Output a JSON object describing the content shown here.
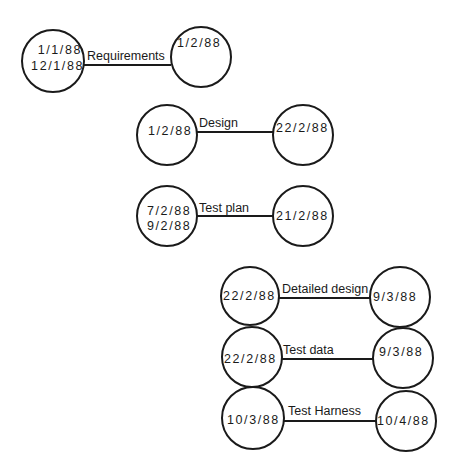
{
  "diagram": {
    "type": "activity-network",
    "activities": [
      {
        "label": "Requirements",
        "start_node": {
          "dates": [
            "1/1/88",
            "12/1/88"
          ]
        },
        "end_node": {
          "dates": [
            "1/2/88"
          ]
        }
      },
      {
        "label": "Design",
        "start_node": {
          "dates": [
            "1/2/88"
          ]
        },
        "end_node": {
          "dates": [
            "22/2/88"
          ]
        }
      },
      {
        "label": "Test plan",
        "start_node": {
          "dates": [
            "7/2/88",
            "9/2/88"
          ]
        },
        "end_node": {
          "dates": [
            "21/2/88"
          ]
        }
      },
      {
        "label": "Detailed design",
        "start_node": {
          "dates": [
            "22/2/88"
          ]
        },
        "end_node": {
          "dates": [
            "9/3/88"
          ]
        }
      },
      {
        "label": "Test data",
        "start_node": {
          "dates": [
            "22/2/88"
          ]
        },
        "end_node": {
          "dates": [
            "9/3/88"
          ]
        }
      },
      {
        "label": "Test Harness",
        "start_node": {
          "dates": [
            "10/3/88"
          ]
        },
        "end_node": {
          "dates": [
            "10/4/88"
          ]
        }
      }
    ]
  }
}
